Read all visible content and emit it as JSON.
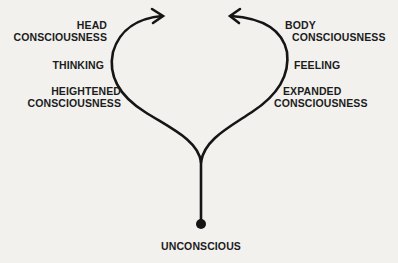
{
  "diagram": {
    "left_branch": {
      "labels": [
        {
          "line1": "HEAD",
          "line2": "CONSCIOUSNESS"
        },
        {
          "line1": "THINKING"
        },
        {
          "line1": "HEIGHTENED",
          "line2": "CONSCIOUSNESS"
        }
      ]
    },
    "right_branch": {
      "labels": [
        {
          "line1": "BODY",
          "line2": "CONSCIOUSNESS"
        },
        {
          "line1": "FEELING"
        },
        {
          "line1": "EXPANDED",
          "line2": "CONSCIOUSNESS"
        }
      ]
    },
    "root": {
      "label": "UNCONSCIOUS"
    },
    "colors": {
      "stroke": "#151515",
      "background": "#f2f1ee"
    }
  }
}
